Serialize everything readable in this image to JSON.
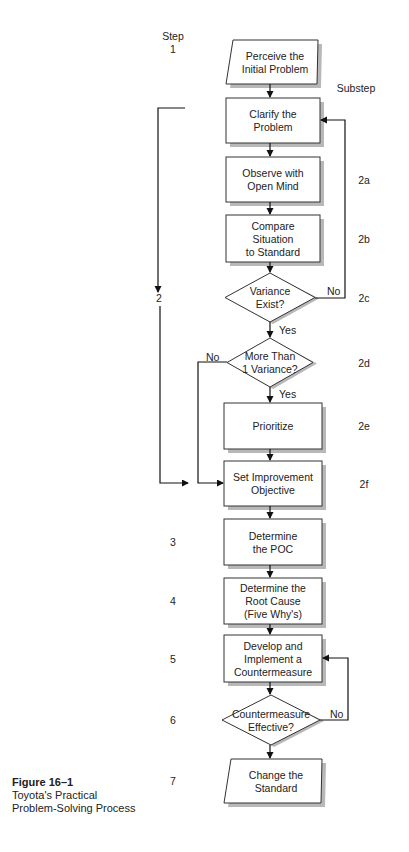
{
  "header": {
    "step_heading": "Step",
    "substep_heading": "Substep"
  },
  "nodes": [
    {
      "id": "perceive",
      "shape": "parallelogram",
      "lines": [
        "Perceive the",
        "Initial Problem"
      ],
      "step": "1",
      "substep": ""
    },
    {
      "id": "clarify",
      "shape": "box",
      "lines": [
        "Clarify the",
        "Problem"
      ],
      "step": "",
      "substep": ""
    },
    {
      "id": "observe",
      "shape": "box",
      "lines": [
        "Observe with",
        "Open Mind"
      ],
      "step": "",
      "substep": "2a"
    },
    {
      "id": "compare",
      "shape": "box",
      "lines": [
        "Compare",
        "Situation",
        "to Standard"
      ],
      "step": "",
      "substep": "2b"
    },
    {
      "id": "variance",
      "shape": "diamond",
      "lines": [
        "Variance",
        "Exist?"
      ],
      "step": "2",
      "substep": "2c"
    },
    {
      "id": "more",
      "shape": "diamond",
      "lines": [
        "More Than",
        "1 Variance?"
      ],
      "step": "",
      "substep": "2d"
    },
    {
      "id": "prioritize",
      "shape": "box",
      "lines": [
        "Prioritize"
      ],
      "step": "",
      "substep": "2e"
    },
    {
      "id": "objective",
      "shape": "box",
      "lines": [
        "Set Improvement",
        "Objective"
      ],
      "step": "",
      "substep": "2f"
    },
    {
      "id": "poc",
      "shape": "box",
      "lines": [
        "Determine",
        "the POC"
      ],
      "step": "3",
      "substep": ""
    },
    {
      "id": "root",
      "shape": "box",
      "lines": [
        "Determine the",
        "Root Cause",
        "(Five Why's)"
      ],
      "step": "4",
      "substep": ""
    },
    {
      "id": "develop",
      "shape": "box",
      "lines": [
        "Develop and",
        "Implement a",
        "Countermeasure"
      ],
      "step": "5",
      "substep": ""
    },
    {
      "id": "effective",
      "shape": "diamond",
      "lines": [
        "Countermeasure",
        "Effective?"
      ],
      "step": "6",
      "substep": ""
    },
    {
      "id": "change",
      "shape": "parallelogram",
      "lines": [
        "Change the",
        "Standard"
      ],
      "step": "7",
      "substep": ""
    }
  ],
  "edge_labels": {
    "variance_no": "No",
    "variance_yes": "Yes",
    "more_no": "No",
    "more_yes": "Yes",
    "effective_no": "No"
  },
  "caption": {
    "figure": "Figure 16–1",
    "line1": "Toyota's Practical",
    "line2": "Problem-Solving Process"
  }
}
